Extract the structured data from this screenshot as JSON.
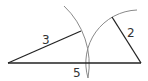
{
  "diagram": {
    "labels": {
      "left_segment": "3",
      "right_segment": "2",
      "base": "5"
    },
    "colors": {
      "segment": "#222222",
      "arc": "#888888"
    }
  }
}
